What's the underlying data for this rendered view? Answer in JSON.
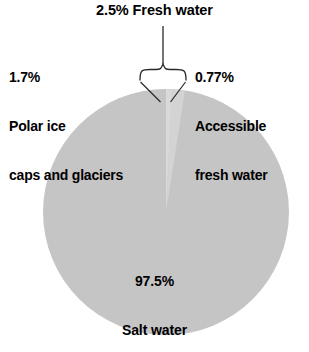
{
  "figure": {
    "background_color": "#ffffff",
    "text_color": "#000000"
  },
  "annotations": {
    "title": "2.5% Fresh water",
    "left_label": {
      "percent": "1.7%",
      "line2": "Polar ice",
      "line3": "caps and glaciers"
    },
    "right_label": {
      "percent": "0.77%",
      "line2": "Accessible",
      "line3": "fresh water"
    },
    "center_label": {
      "percent": "97.5%",
      "line2": "Salt water"
    }
  },
  "chart_data": {
    "type": "pie",
    "title": "2.5% Fresh water",
    "xlabel": "",
    "ylabel": "",
    "legend_position": "none",
    "grid": false,
    "units": "percent of Earth's water",
    "start_angle_deg": 90,
    "direction": "counterclockwise",
    "categories": [
      "Salt water",
      "Polar ice caps and glaciers",
      "Accessible fresh water"
    ],
    "values": [
      97.5,
      1.7,
      0.77
    ],
    "labels": [
      "97.5%",
      "1.7%",
      "0.77%"
    ],
    "colors": [
      "#c5c5c5",
      "#d3d3d3",
      "#d9d9d9"
    ],
    "groups": [
      {
        "name": "Fresh water",
        "value": 2.5,
        "label": "2.5% Fresh water",
        "members": [
          "Polar ice caps and glaciers",
          "Accessible fresh water"
        ]
      }
    ],
    "geometry": {
      "center_x": 166,
      "center_y": 212,
      "radius": 123
    }
  }
}
